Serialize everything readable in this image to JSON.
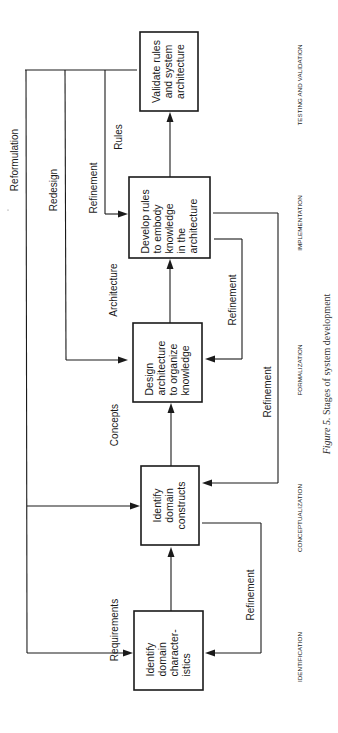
{
  "figure": {
    "caption_label": "Figure 5.",
    "caption_text": "Stages of system development",
    "orientation": "rotated 90° counter-clockwise (landscape figure on portrait page)"
  },
  "stages": [
    {
      "label": "IDENTIFICATION"
    },
    {
      "label": "CONCEPTUALIZATION"
    },
    {
      "label": "FORMALIZATION"
    },
    {
      "label": "IMPLEMENTATION"
    },
    {
      "label": "TESTING AND VALIDATION"
    }
  ],
  "boxes": [
    {
      "id": "identify-characteristics",
      "lines": [
        "Identify",
        "domain",
        "character-",
        "istics"
      ]
    },
    {
      "id": "identify-constructs",
      "lines": [
        "Identify",
        "domain",
        "constructs"
      ]
    },
    {
      "id": "design-architecture",
      "lines": [
        "Design",
        "architecture",
        "to organize",
        "knowledge"
      ]
    },
    {
      "id": "develop-rules",
      "lines": [
        "Develop rules",
        "to embody",
        "knowledge",
        "in the",
        "architecture"
      ]
    },
    {
      "id": "validate-rules",
      "lines": [
        "Validate rules",
        "and system",
        "architecture"
      ]
    }
  ],
  "forward_flows": [
    {
      "label": "Requirements"
    },
    {
      "label": "Concepts"
    },
    {
      "label": "Architecture"
    },
    {
      "label": "Rules"
    }
  ],
  "feedback_flows": {
    "reformulation": "Reformulation",
    "redesign": "Redesign",
    "refinement_top": "Refinement",
    "refinement_formalization": "Refinement",
    "refinement_conceptualization": "Refinement",
    "refinement_identification": "Refinement"
  },
  "colors": {
    "ink": "#1a1a1a",
    "paper": "#ffffff",
    "caption": "#333333"
  }
}
